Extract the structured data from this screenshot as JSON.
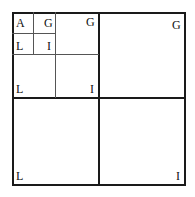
{
  "diagram": {
    "labels": {
      "tl_small_a": "A",
      "tl_small_g": "G",
      "tl_small_l": "L",
      "tl_small_i": "I",
      "tr_mid_g": "G",
      "bl_mid_l": "L",
      "br_mid_i": "I",
      "tr_big_g": "G",
      "bl_big_l": "L",
      "br_big_i": "I"
    }
  }
}
